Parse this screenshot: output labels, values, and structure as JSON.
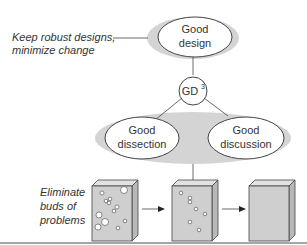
{
  "diagram": {
    "nodes": {
      "good_design": {
        "line1": "Good",
        "line2": "design"
      },
      "gd3": {
        "label": "GD",
        "superscript": "3"
      },
      "good_dissection": {
        "line1": "Good",
        "line2": "dissection"
      },
      "good_discussion": {
        "line1": "Good",
        "line2": "discussion"
      }
    },
    "annotations": {
      "top": {
        "line1": "Keep robust designs,",
        "line2": "minimize change"
      },
      "bottom": {
        "line1": "Eliminate",
        "line2": "buds of",
        "line3": "problems"
      }
    },
    "boxes": [
      "many-bubbles",
      "few-bubbles",
      "no-bubbles"
    ],
    "colors": {
      "halo": "#d4d4d4",
      "box_fill": "#cfcfcf",
      "box_side": "#b8b8b8",
      "line": "#444444"
    }
  }
}
